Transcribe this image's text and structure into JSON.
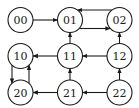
{
  "diagram": {
    "type": "state-transition-grid",
    "colors": {
      "stroke": "#1a1a1a",
      "fill": "#ffffff"
    },
    "nodes": [
      {
        "id": "00",
        "label": "00",
        "row": 0,
        "col": 0
      },
      {
        "id": "01",
        "label": "01",
        "row": 0,
        "col": 1
      },
      {
        "id": "02",
        "label": "02",
        "row": 0,
        "col": 2
      },
      {
        "id": "10",
        "label": "10",
        "row": 1,
        "col": 0
      },
      {
        "id": "11",
        "label": "11",
        "row": 1,
        "col": 1
      },
      {
        "id": "12",
        "label": "12",
        "row": 1,
        "col": 2
      },
      {
        "id": "20",
        "label": "20",
        "row": 2,
        "col": 0
      },
      {
        "id": "21",
        "label": "21",
        "row": 2,
        "col": 1
      },
      {
        "id": "22",
        "label": "22",
        "row": 2,
        "col": 2
      }
    ],
    "edges": [
      {
        "from": "00",
        "to": "01"
      },
      {
        "from": "02",
        "to": "01",
        "lane": "upper"
      },
      {
        "from": "01",
        "to": "02",
        "lane": "lower"
      },
      {
        "from": "11",
        "to": "01"
      },
      {
        "from": "12",
        "to": "02"
      },
      {
        "from": "11",
        "to": "10"
      },
      {
        "from": "12",
        "to": "11"
      },
      {
        "from": "10",
        "to": "20",
        "lane": "left"
      },
      {
        "from": "20",
        "to": "10",
        "lane": "right"
      },
      {
        "from": "21",
        "to": "11"
      },
      {
        "from": "22",
        "to": "12"
      },
      {
        "from": "21",
        "to": "20"
      },
      {
        "from": "22",
        "to": "21"
      }
    ]
  }
}
